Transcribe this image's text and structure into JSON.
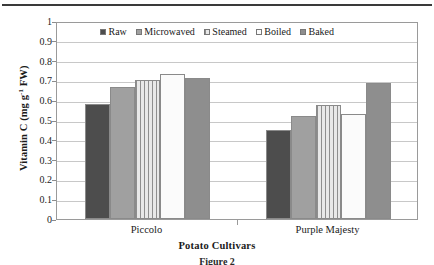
{
  "chart_data": {
    "type": "bar",
    "title": "",
    "xlabel": "Potato Cultivars",
    "ylabel": "Vitamin C (mg g-1 FW)",
    "ylabel_parts": {
      "prefix": "Vitamin C (mg g",
      "superscript": "-1",
      "suffix": " FW)"
    },
    "categories": [
      "Piccolo",
      "Purple Majesty"
    ],
    "series": [
      {
        "name": "Raw",
        "values": [
          0.58,
          0.45
        ]
      },
      {
        "name": "Microwaved",
        "values": [
          0.665,
          0.52
        ]
      },
      {
        "name": "Steamed",
        "values": [
          0.7,
          0.575
        ]
      },
      {
        "name": "Boiled",
        "values": [
          0.73,
          0.53
        ]
      },
      {
        "name": "Baked",
        "values": [
          0.71,
          0.685
        ]
      }
    ],
    "ylim": [
      0,
      1
    ],
    "yticks": [
      "0",
      "0.1",
      "0.2",
      "0.3",
      "0.4",
      "0.5",
      "0.6",
      "0.7",
      "0.8",
      "0.9",
      "1"
    ],
    "grid": true,
    "legend_position": "top-center",
    "colors": {
      "raw": "#4d4d4d",
      "microwaved": "#a0a0a0",
      "steamed": "#d8d8d8",
      "boiled": "#fbfbfb",
      "baked": "#8e8e8e"
    }
  },
  "caption": "Figure 2"
}
